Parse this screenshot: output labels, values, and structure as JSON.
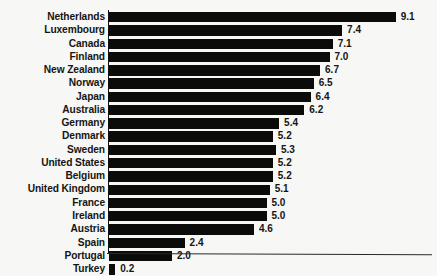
{
  "chart_data": {
    "type": "bar",
    "orientation": "horizontal",
    "title": "",
    "subtitle": "",
    "xlabel": "",
    "ylabel": "",
    "categories": [
      "Netherlands",
      "Luxembourg",
      "Canada",
      "Finland",
      "New Zealand",
      "Norway",
      "Japan",
      "Australia",
      "Germany",
      "Denmark",
      "Sweden",
      "United States",
      "Belgium",
      "United Kingdom",
      "France",
      "Ireland",
      "Austria",
      "Spain",
      "Portugal",
      "Turkey"
    ],
    "values": [
      9.1,
      7.4,
      7.1,
      7.0,
      6.7,
      6.5,
      6.4,
      6.2,
      5.4,
      5.2,
      5.3,
      5.2,
      5.2,
      5.1,
      5.0,
      5.0,
      4.6,
      2.4,
      2.0,
      0.2
    ],
    "value_labels": [
      "9.1",
      "7.4",
      "7.1",
      "7.0",
      "6.7",
      "6.5",
      "6.4",
      "6.2",
      "5.4",
      "5.2",
      "5.3",
      "5.2",
      "5.2",
      "5.1",
      "5.0",
      "5.0",
      "4.6",
      "2.4",
      "2.0",
      "0.2"
    ],
    "xlim": [
      0,
      9.1
    ],
    "grid": false,
    "legend": false,
    "bar_color": "#0b0b0a",
    "background_color": "#f7f7f5",
    "text_color": "#151513"
  }
}
